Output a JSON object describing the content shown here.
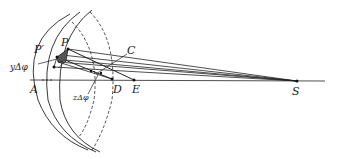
{
  "diagram": {
    "type": "geometric-construction",
    "colors": {
      "line": "#222222",
      "shade": "#555555",
      "background": "#ffffff"
    },
    "labels": {
      "P_prime": "P′",
      "P": "P",
      "C": "C",
      "y_dphi": "yΔφ",
      "A": "A",
      "z_dphi": "zΔφ",
      "D": "D",
      "E": "E",
      "S": "S"
    },
    "points": {
      "A": [
        34,
        80
      ],
      "P": [
        68,
        49
      ],
      "P_prime": [
        57,
        57
      ],
      "C": [
        100,
        70
      ],
      "D": [
        112,
        79
      ],
      "E": [
        134,
        80
      ],
      "S": [
        297,
        81
      ]
    }
  }
}
